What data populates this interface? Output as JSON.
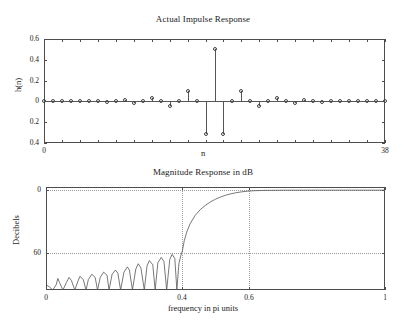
{
  "figure": {
    "width": 406,
    "height": 322,
    "background": "#ffffff",
    "line_color": "#555555",
    "axis_color": "#4d4d4d",
    "grid_color": "#9a9a9a"
  },
  "subplots": [
    {
      "name": "impulse-response",
      "title": "Actual Impulse Response",
      "xlabel": "n",
      "ylabel": "h(n)",
      "xticks": [
        0,
        38
      ],
      "xtick_labels": [
        "0",
        "38"
      ],
      "yticks": [
        0.6,
        0.4,
        0.2,
        0,
        -0.2,
        -0.4
      ],
      "ytick_labels": [
        "0.6",
        "0.4",
        "0.2",
        "0",
        "0.2",
        "0.4"
      ],
      "xlim": [
        0,
        38
      ],
      "ylim": [
        -0.4,
        0.6
      ],
      "grid": false
    },
    {
      "name": "magnitude-response",
      "title": "Magnitude Response in dB",
      "xlabel": "frequency in pi units",
      "ylabel": "Decibels",
      "xticks": [
        0,
        0.4,
        0.6,
        1
      ],
      "xtick_labels": [
        "0",
        "0.4",
        "0.6",
        "1"
      ],
      "yticks": [
        0,
        -60
      ],
      "ytick_labels": [
        "0",
        "60"
      ],
      "xlim": [
        0,
        1
      ],
      "ylim": [
        -95,
        3
      ],
      "grid": true
    }
  ],
  "chart_data": [
    {
      "type": "stem",
      "title": "Actual Impulse Response",
      "xlabel": "n",
      "ylabel": "h(n)",
      "xlim": [
        0,
        38
      ],
      "ylim": [
        -0.4,
        0.6
      ],
      "grid": false,
      "x": [
        0,
        1,
        2,
        3,
        4,
        5,
        6,
        7,
        8,
        9,
        10,
        11,
        12,
        13,
        14,
        15,
        16,
        17,
        18,
        19,
        20,
        21,
        22,
        23,
        24,
        25,
        26,
        27,
        28,
        29,
        30,
        31,
        32,
        33,
        34,
        35,
        36,
        37,
        38
      ],
      "values": [
        0.0,
        0.002,
        0.0,
        -0.003,
        0.0,
        0.004,
        0.0,
        -0.006,
        0.0,
        0.009,
        0.0,
        -0.013,
        0.0,
        0.019,
        0.0,
        -0.03,
        0.0,
        0.052,
        0.0,
        -0.11,
        0.0,
        0.031,
        -0.31,
        0.5,
        -0.31,
        0.031,
        0.0,
        -0.11,
        0.0,
        0.052,
        0.0,
        -0.03,
        0.0,
        0.019,
        0.0,
        -0.013,
        0.0,
        0.009,
        0.0
      ],
      "stems": [
        {
          "n": 0,
          "y": 0.0
        },
        {
          "n": 1,
          "y": 0.002
        },
        {
          "n": 2,
          "y": 0.0
        },
        {
          "n": 3,
          "y": 0.003
        },
        {
          "n": 4,
          "y": 0.0
        },
        {
          "n": 5,
          "y": 0.004
        },
        {
          "n": 6,
          "y": 0.0
        },
        {
          "n": 7,
          "y": -0.006
        },
        {
          "n": 8,
          "y": 0.0
        },
        {
          "n": 9,
          "y": 0.009
        },
        {
          "n": 10,
          "y": -0.012
        },
        {
          "n": 11,
          "y": 0.0
        },
        {
          "n": 12,
          "y": 0.03
        },
        {
          "n": 13,
          "y": 0.0
        },
        {
          "n": 14,
          "y": -0.048
        },
        {
          "n": 15,
          "y": 0.0
        },
        {
          "n": 16,
          "y": 0.103
        },
        {
          "n": 17,
          "y": 0.0
        },
        {
          "n": 18,
          "y": -0.31
        },
        {
          "n": 19,
          "y": 0.5
        },
        {
          "n": 20,
          "y": -0.31
        },
        {
          "n": 21,
          "y": 0.0
        },
        {
          "n": 22,
          "y": 0.103
        },
        {
          "n": 23,
          "y": 0.0
        },
        {
          "n": 24,
          "y": -0.048
        },
        {
          "n": 25,
          "y": 0.0
        },
        {
          "n": 26,
          "y": 0.03
        },
        {
          "n": 27,
          "y": 0.0
        },
        {
          "n": 28,
          "y": -0.012
        },
        {
          "n": 29,
          "y": 0.009
        },
        {
          "n": 30,
          "y": 0.0
        },
        {
          "n": 31,
          "y": -0.006
        },
        {
          "n": 32,
          "y": 0.0
        },
        {
          "n": 33,
          "y": 0.004
        },
        {
          "n": 34,
          "y": 0.0
        },
        {
          "n": 35,
          "y": 0.003
        },
        {
          "n": 36,
          "y": 0.0
        },
        {
          "n": 37,
          "y": 0.002
        },
        {
          "n": 38,
          "y": 0.0
        }
      ]
    },
    {
      "type": "line",
      "title": "Magnitude Response in dB",
      "xlabel": "frequency in pi units",
      "ylabel": "Decibels",
      "xlim": [
        0,
        1
      ],
      "ylim": [
        -95,
        3
      ],
      "grid": true,
      "gridlines_v": [
        0.4,
        0.6
      ],
      "gridlines_h": [
        0,
        -60
      ],
      "description": "Highpass FIR filter: equiripple stopband up to 0.4 pi, transition band, passband from about 0.6 pi to 1",
      "series": [
        {
          "name": "Magnitude (dB)",
          "x": [
            0.0,
            0.01,
            0.02,
            0.03,
            0.035,
            0.04,
            0.05,
            0.06,
            0.068,
            0.075,
            0.085,
            0.095,
            0.1,
            0.11,
            0.118,
            0.125,
            0.135,
            0.145,
            0.152,
            0.16,
            0.17,
            0.18,
            0.186,
            0.195,
            0.205,
            0.212,
            0.22,
            0.23,
            0.24,
            0.246,
            0.255,
            0.265,
            0.272,
            0.28,
            0.29,
            0.298,
            0.305,
            0.315,
            0.322,
            0.33,
            0.34,
            0.348,
            0.356,
            0.365,
            0.372,
            0.38,
            0.386,
            0.392,
            0.398,
            0.402,
            0.408,
            0.415,
            0.425,
            0.44,
            0.455,
            0.47,
            0.485,
            0.5,
            0.515,
            0.53,
            0.545,
            0.56,
            0.575,
            0.59,
            0.61,
            0.64,
            0.7,
            0.8,
            0.9,
            1.0
          ],
          "y": [
            -90.0,
            -92.0,
            -95.0,
            -90.0,
            -84.0,
            -88.0,
            -95.0,
            -88.0,
            -83.0,
            -86.0,
            -95.0,
            -86.0,
            -82.0,
            -85.0,
            -95.0,
            -85.0,
            -80.0,
            -83.0,
            -95.0,
            -83.0,
            -78.0,
            -81.0,
            -95.0,
            -80.0,
            -76.0,
            -79.0,
            -95.0,
            -78.0,
            -73.0,
            -76.0,
            -95.0,
            -75.0,
            -70.0,
            -74.0,
            -95.0,
            -72.0,
            -67.0,
            -71.0,
            -95.0,
            -69.0,
            -64.0,
            -68.0,
            -95.0,
            -66.0,
            -61.0,
            -65.0,
            -95.0,
            -70.0,
            -62.0,
            -58.0,
            -48.0,
            -40.0,
            -32.0,
            -24.0,
            -18.5,
            -14.5,
            -11.2,
            -8.6,
            -6.5,
            -4.8,
            -3.5,
            -2.5,
            -1.7,
            -1.1,
            -0.6,
            -0.25,
            -0.05,
            -0.01,
            -0.01,
            -0.01
          ]
        }
      ]
    }
  ]
}
